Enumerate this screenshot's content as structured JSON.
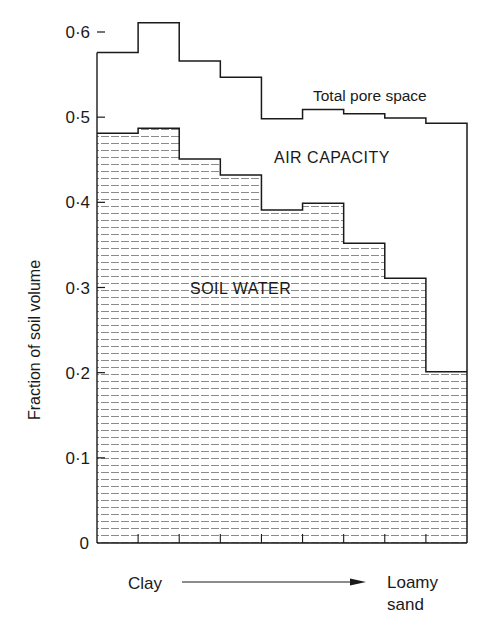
{
  "chart_data": {
    "type": "area",
    "subtype": "step",
    "title": "",
    "xlabel": "",
    "ylabel": "Fraction of soil volume",
    "ylim": [
      0,
      0.6
    ],
    "yticks": [
      0,
      0.1,
      0.2,
      0.3,
      0.4,
      0.5,
      0.6
    ],
    "ytick_labels": [
      "0",
      "0·1",
      "0·2",
      "0·3",
      "0·4",
      "0·5",
      "0·6"
    ],
    "x_axis_start_label": "Clay",
    "x_axis_end_label_line1": "Loamy",
    "x_axis_end_label_line2": "sand",
    "x_axis_arrow": true,
    "bins": 9,
    "categories": [
      "1",
      "2",
      "3",
      "4",
      "5",
      "6",
      "7",
      "8",
      "9"
    ],
    "series": [
      {
        "name": "Total pore space",
        "style": "step-line",
        "values": [
          0.576,
          0.611,
          0.566,
          0.547,
          0.498,
          0.509,
          0.504,
          0.499,
          0.493
        ]
      },
      {
        "name": "Soil water",
        "style": "step-area-dashed-hatch",
        "values": [
          0.481,
          0.487,
          0.451,
          0.432,
          0.391,
          0.399,
          0.352,
          0.311,
          0.201
        ]
      }
    ],
    "region_labels": {
      "air_capacity": "AIR CAPACITY",
      "soil_water": "SOIL WATER"
    },
    "annotations": {
      "total_pore_space": "Total pore space"
    },
    "grid": false,
    "legend": "none"
  },
  "colors": {
    "ink": "#1a1a1a",
    "hatch": "#8a8a8a",
    "background": "#ffffff"
  }
}
